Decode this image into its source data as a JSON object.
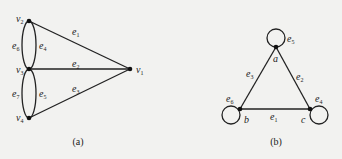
{
  "figure_a": {
    "caption": "(a)",
    "vertices": [
      {
        "id": "v1",
        "name": "v",
        "sub": "1"
      },
      {
        "id": "v2",
        "name": "v",
        "sub": "2"
      },
      {
        "id": "v3",
        "name": "v",
        "sub": "3"
      },
      {
        "id": "v4",
        "name": "v",
        "sub": "4"
      }
    ],
    "edges": [
      {
        "id": "e1",
        "name": "e",
        "sub": "1",
        "from": "v2",
        "to": "v1"
      },
      {
        "id": "e2",
        "name": "e",
        "sub": "2",
        "from": "v3",
        "to": "v1"
      },
      {
        "id": "e3",
        "name": "e",
        "sub": "3",
        "from": "v4",
        "to": "v1"
      },
      {
        "id": "e4",
        "name": "e",
        "sub": "4",
        "from": "v2",
        "to": "v3"
      },
      {
        "id": "e5",
        "name": "e",
        "sub": "5",
        "from": "v3",
        "to": "v4"
      },
      {
        "id": "e6",
        "name": "e",
        "sub": "6",
        "from": "v2",
        "to": "v3"
      },
      {
        "id": "e7",
        "name": "e",
        "sub": "7",
        "from": "v3",
        "to": "v4"
      }
    ]
  },
  "figure_b": {
    "caption": "(b)",
    "vertices": [
      {
        "id": "a",
        "name": "a"
      },
      {
        "id": "b",
        "name": "b"
      },
      {
        "id": "c",
        "name": "c"
      }
    ],
    "edges": [
      {
        "id": "e1",
        "name": "e",
        "sub": "1",
        "from": "b",
        "to": "c"
      },
      {
        "id": "e2",
        "name": "e",
        "sub": "2",
        "from": "a",
        "to": "c"
      },
      {
        "id": "e3",
        "name": "e",
        "sub": "3",
        "from": "a",
        "to": "b"
      },
      {
        "id": "e4",
        "name": "e",
        "sub": "4",
        "from": "c",
        "to": "c"
      },
      {
        "id": "e5",
        "name": "e",
        "sub": "5",
        "from": "a",
        "to": "a"
      },
      {
        "id": "e6",
        "name": "e",
        "sub": "6",
        "from": "b",
        "to": "b"
      }
    ]
  }
}
